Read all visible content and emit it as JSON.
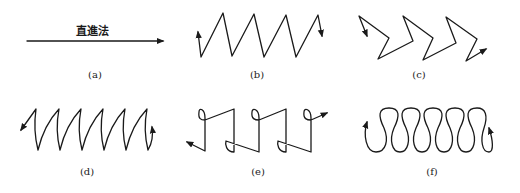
{
  "figure": {
    "panels": [
      {
        "id": "a",
        "label": "(a)",
        "caption": "直進法",
        "pattern": "straight-line"
      },
      {
        "id": "b",
        "label": "(b)",
        "pattern": "zigzag"
      },
      {
        "id": "c",
        "label": "(c)",
        "pattern": "chevron-zigzag"
      },
      {
        "id": "d",
        "label": "(d)",
        "pattern": "curved-sawtooth"
      },
      {
        "id": "e",
        "label": "(e)",
        "pattern": "looped-square-wave"
      },
      {
        "id": "f",
        "label": "(f)",
        "pattern": "figure-eight-loops"
      }
    ]
  },
  "colors": {
    "stroke": "#1a1a1a",
    "background": "#ffffff"
  }
}
